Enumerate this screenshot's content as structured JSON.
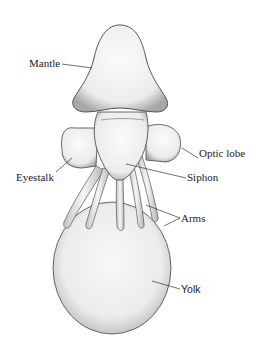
{
  "figure": {
    "colors": {
      "ink": "#222222",
      "stipple": "#9a9a9a",
      "fill": "#f4f4f4",
      "background": "#ffffff"
    }
  },
  "labels": [
    {
      "id": "mantle",
      "text": "Mantle"
    },
    {
      "id": "optic_lobe",
      "text": "Optic lobe"
    },
    {
      "id": "eyestalk",
      "text": "Eyestalk"
    },
    {
      "id": "siphon",
      "text": "Siphon"
    },
    {
      "id": "arms",
      "text": "Arms"
    },
    {
      "id": "yolk",
      "text": "Yolk"
    }
  ]
}
